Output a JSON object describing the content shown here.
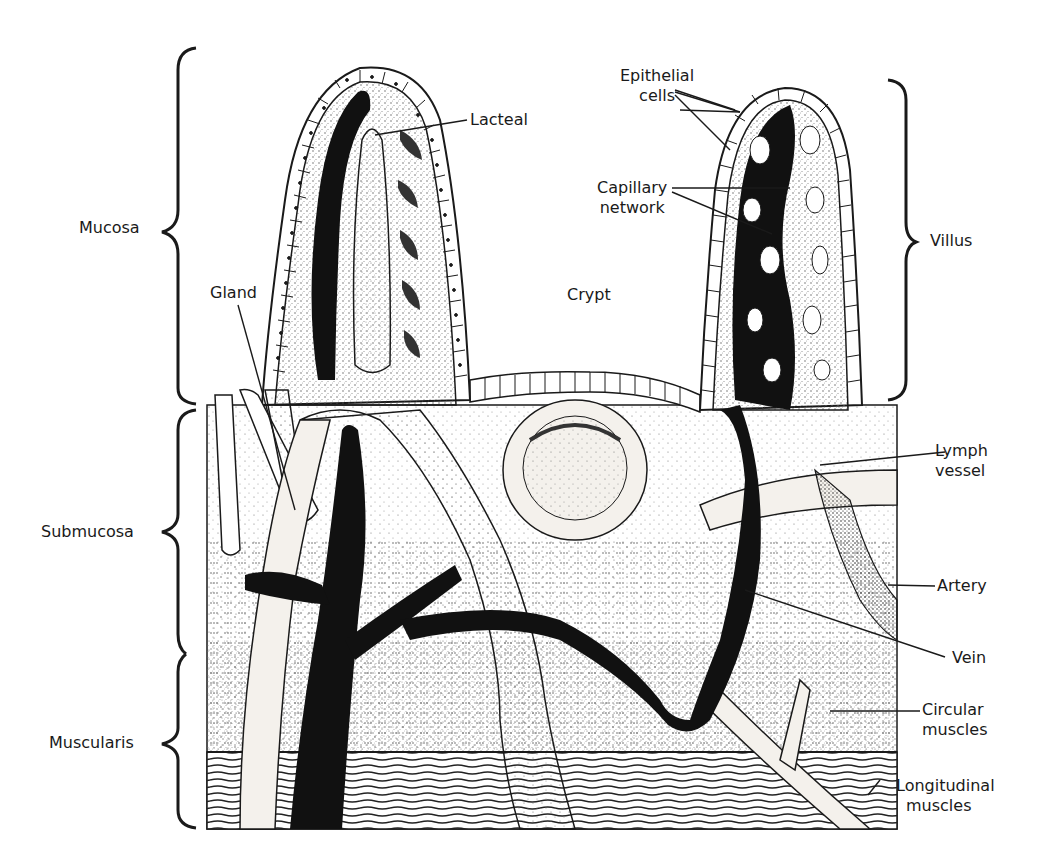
{
  "diagram": {
    "layers_left": [
      {
        "id": "mucosa",
        "label": "Mucosa"
      },
      {
        "id": "submucosa",
        "label": "Submucosa"
      },
      {
        "id": "muscularis",
        "label": "Muscularis"
      }
    ],
    "structures": {
      "gland": "Gland",
      "lacteal": "Lacteal",
      "crypt": "Crypt",
      "epithelial_cells": {
        "line1": "Epithelial",
        "line2": "cells"
      },
      "capillary_network": {
        "line1": "Capillary",
        "line2": "network"
      },
      "villus": "Villus",
      "lymph_vessel": {
        "line1": "Lymph",
        "line2": "vessel"
      },
      "artery": "Artery",
      "vein": "Vein",
      "circular_muscles": {
        "line1": "Circular",
        "line2": "muscles"
      },
      "longitudinal_muscles": {
        "line1": "Longitudinal",
        "line2": "muscles"
      }
    },
    "colors": {
      "ink": "#1a1a1a",
      "paper": "#ffffff",
      "stipple": "#6b6b6b",
      "vessel_light": "#f4f1ec"
    }
  }
}
